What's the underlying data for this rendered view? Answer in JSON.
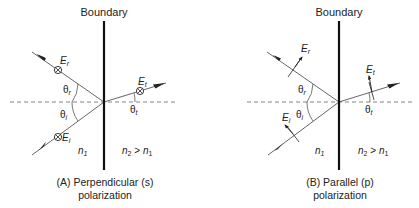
{
  "colors": {
    "ink": "#222222",
    "ray": "#555555",
    "dash": "#777777",
    "background": "#ffffff"
  },
  "panels": [
    {
      "id": "A",
      "boundary_label": "Boundary",
      "caption_line1": "(A) Perpendicular (s)",
      "caption_line2": "polarization",
      "labels": {
        "E_r_base": "E",
        "E_r_sub": "r",
        "E_t_base": "E",
        "E_t_sub": "t",
        "E_i_base": "E",
        "E_i_sub": "i",
        "theta_r_base": "θ",
        "theta_r_sub": "r",
        "theta_i_base": "θ",
        "theta_i_sub": "i",
        "theta_t_base": "θ",
        "theta_t_sub": "t",
        "n1_base": "n",
        "n1_sub": "1",
        "n2_base": "n",
        "n2_sub": "2",
        "n2_rel": " > ",
        "n2_cmp_base": "n",
        "n2_cmp_sub": "1"
      },
      "field_symbol": "circle-cross (into page)"
    },
    {
      "id": "B",
      "boundary_label": "Boundary",
      "caption_line1": "(B) Parallel (p)",
      "caption_line2": "polarization",
      "labels": {
        "E_r_base": "E",
        "E_r_sub": "r",
        "E_t_base": "E",
        "E_t_sub": "t",
        "E_i_base": "E",
        "E_i_sub": "i",
        "theta_r_base": "θ",
        "theta_r_sub": "r",
        "theta_i_base": "θ",
        "theta_i_sub": "i",
        "theta_t_base": "θ",
        "theta_t_sub": "t",
        "n1_base": "n",
        "n1_sub": "1",
        "n2_base": "n",
        "n2_sub": "2",
        "n2_rel": " > ",
        "n2_cmp_base": "n",
        "n2_cmp_sub": "1"
      },
      "field_symbol": "in-plane arrow"
    }
  ]
}
